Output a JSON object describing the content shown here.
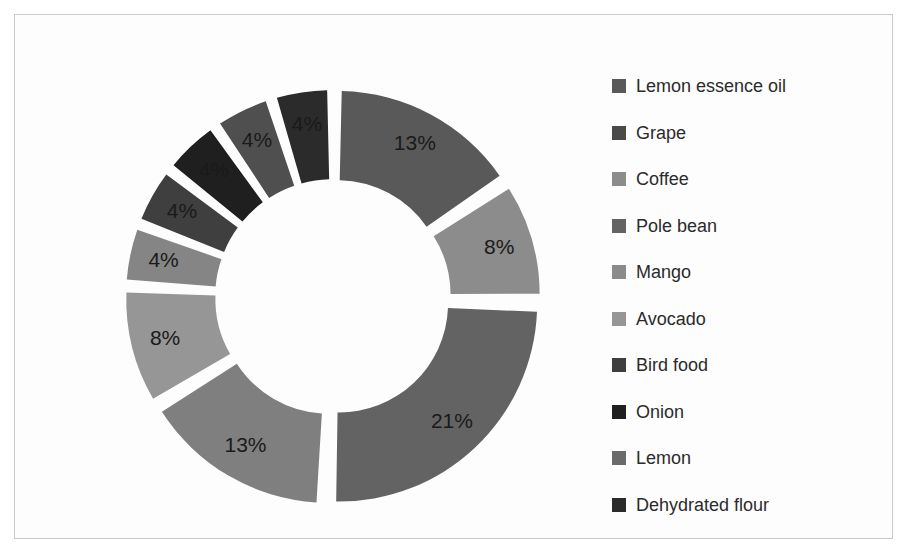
{
  "frame": {
    "border_color": "#c9c9c9",
    "background": "#fdfdfd"
  },
  "chart_data": {
    "type": "pie",
    "variant": "doughnut-exploded",
    "title": "",
    "subtitle": "",
    "xlabel": "",
    "ylabel": "",
    "grid": false,
    "legend_position": "right",
    "value_suffix": "%",
    "start_angle_deg": 0,
    "direction": "clockwise",
    "inner_radius_ratio": 0.55,
    "explode_offset_px": 9,
    "categories": [
      "Lemon essence oil",
      "Grape",
      "Coffee",
      "Pole bean",
      "Mango",
      "Avocado",
      "Bird food",
      "Onion",
      "Lemon",
      "Dehydrated flour"
    ],
    "values": [
      13,
      8,
      21,
      13,
      8,
      4,
      4,
      4,
      4,
      4
    ],
    "labels": [
      "13%",
      "8%",
      "21%",
      "13%",
      "8%",
      "4%",
      "4%",
      "4%",
      "4%",
      "4%"
    ],
    "colors": [
      "#595959",
      "#8c8c8c",
      "#636363",
      "#7f7f7f",
      "#969696",
      "#858585",
      "#3f3f3f",
      "#1f1f1f",
      "#4f4f4f",
      "#2b2b2b"
    ],
    "label_text_color": "#1a1a1a",
    "total": 83
  },
  "legend": {
    "items": [
      {
        "label": "Lemon essence oil",
        "color": "#595959"
      },
      {
        "label": "Grape",
        "color": "#4a4a4a"
      },
      {
        "label": "Coffee",
        "color": "#8c8c8c"
      },
      {
        "label": "Pole bean",
        "color": "#636363"
      },
      {
        "label": "Mango",
        "color": "#8a8a8a"
      },
      {
        "label": "Avocado",
        "color": "#969696"
      },
      {
        "label": "Bird food",
        "color": "#3f3f3f"
      },
      {
        "label": "Onion",
        "color": "#1f1f1f"
      },
      {
        "label": "Lemon",
        "color": "#6a6a6a"
      },
      {
        "label": "Dehydrated flour",
        "color": "#2b2b2b"
      }
    ]
  }
}
